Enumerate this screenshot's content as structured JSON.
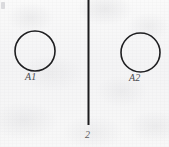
{
  "figure": {
    "kind": "engineering-line-drawing",
    "width": 169,
    "height": 147,
    "background_color": "#f4f4f5",
    "ink_color": "#1e1e20",
    "label_color": "#4a4a4e"
  },
  "circles": [
    {
      "name": "left-circle",
      "label": "A1",
      "center_x": 35,
      "center_y": 51,
      "radius": 20,
      "stroke_width": 1.6,
      "stroke_color": "#1e1e20",
      "fill": "none"
    },
    {
      "name": "right-circle",
      "label": "A2",
      "center_x": 140.5,
      "center_y": 52.5,
      "radius": 19.5,
      "stroke_width": 1.6,
      "stroke_color": "#1e1e20",
      "fill": "none"
    }
  ],
  "axis_line": {
    "name": "vertical-axis-line",
    "label": "2",
    "x": 88.5,
    "y_start": 0,
    "y_end": 125,
    "stroke_width": 2.0,
    "stroke_color": "#1b1b1d"
  },
  "labels": {
    "left_circle": "A1",
    "right_circle": "A2",
    "axis": "2"
  }
}
